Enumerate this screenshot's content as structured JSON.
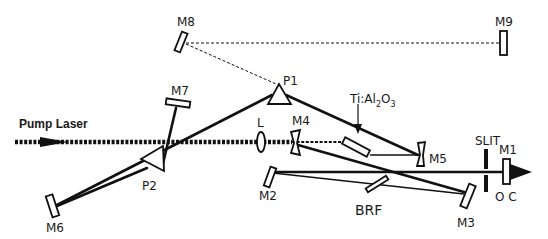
{
  "diagram": {
    "labels": {
      "pump_laser": "Pump Laser",
      "crystal_main": "Ti:Al",
      "crystal_sub1": "2",
      "crystal_o": "O",
      "crystal_sub2": "3",
      "m1": "M1",
      "m2": "M2",
      "m3": "M3",
      "m4": "M4",
      "m5": "M5",
      "m6": "M6",
      "m7": "M7",
      "m8": "M8",
      "m9": "M9",
      "p1": "P1",
      "p2": "P2",
      "lens": "L",
      "brf": "BRF",
      "slit": "SLIT",
      "oc": "O C"
    },
    "components": [
      {
        "id": "M1",
        "type": "output-coupler-mirror"
      },
      {
        "id": "M2",
        "type": "mirror"
      },
      {
        "id": "M3",
        "type": "mirror"
      },
      {
        "id": "M4",
        "type": "curved-mirror"
      },
      {
        "id": "M5",
        "type": "curved-mirror"
      },
      {
        "id": "M6",
        "type": "mirror"
      },
      {
        "id": "M7",
        "type": "mirror"
      },
      {
        "id": "M8",
        "type": "mirror"
      },
      {
        "id": "M9",
        "type": "mirror"
      },
      {
        "id": "P1",
        "type": "prism"
      },
      {
        "id": "P2",
        "type": "prism"
      },
      {
        "id": "L",
        "type": "lens"
      },
      {
        "id": "BRF",
        "type": "birefringent-filter"
      },
      {
        "id": "SLIT",
        "type": "slit"
      },
      {
        "id": "Ti:Al2O3",
        "type": "gain-crystal"
      }
    ],
    "colors": {
      "ink": "#111111",
      "background": "#ffffff"
    }
  }
}
